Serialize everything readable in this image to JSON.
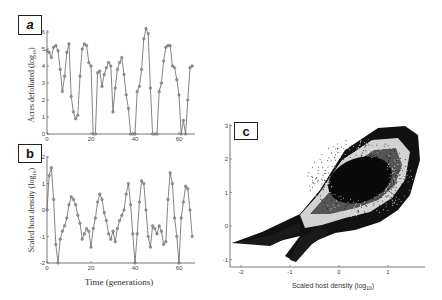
{
  "figure": {
    "panels": [
      {
        "label": "a"
      },
      {
        "label": "b"
      },
      {
        "label": "c"
      }
    ]
  },
  "chart_data": [
    {
      "panel": "a",
      "type": "line",
      "title": "",
      "xlabel": "",
      "ylabel": "Acres defoliated (log10)",
      "xlim": [
        0,
        66
      ],
      "ylim": [
        0,
        6
      ],
      "xticks": [
        0,
        20,
        40,
        60
      ],
      "yticks": [
        0,
        1,
        2,
        3,
        4,
        5,
        6
      ],
      "grid": false,
      "markers": true,
      "x": [
        0,
        1,
        2,
        3,
        4,
        5,
        6,
        7,
        8,
        9,
        10,
        11,
        12,
        13,
        14,
        15,
        16,
        17,
        18,
        19,
        20,
        21,
        22,
        23,
        24,
        25,
        26,
        27,
        28,
        29,
        30,
        31,
        32,
        33,
        34,
        35,
        36,
        37,
        38,
        39,
        40,
        41,
        42,
        43,
        44,
        45,
        46,
        47,
        48,
        49,
        50,
        51,
        52,
        53,
        54,
        55,
        56,
        57,
        58,
        59,
        60,
        61,
        62,
        63,
        64,
        65,
        66
      ],
      "values": [
        4.9,
        4.8,
        4.5,
        5.1,
        5.2,
        4.9,
        3.8,
        2.5,
        3.4,
        4.8,
        5.3,
        2.2,
        1.3,
        0.9,
        1.1,
        3.4,
        5.0,
        5.3,
        5.2,
        4.2,
        4.0,
        0,
        0,
        3.6,
        3.7,
        2.8,
        3.5,
        3.9,
        4.2,
        4.0,
        1.3,
        2.7,
        3.8,
        4.2,
        4.5,
        3.5,
        2.3,
        1.5,
        0,
        0,
        0,
        2.5,
        2.8,
        3.8,
        5.6,
        6.2,
        5.9,
        2.7,
        0,
        0,
        0,
        2.5,
        3.0,
        4.3,
        5.1,
        5.2,
        5.2,
        4.0,
        3.9,
        3.2,
        2.3,
        0,
        0.8,
        0,
        2.0,
        3.9,
        4.0
      ]
    },
    {
      "panel": "b",
      "type": "line",
      "title": "",
      "xlabel": "Time (generations)",
      "ylabel": "Scaled host density (log10)",
      "xlim": [
        0,
        66
      ],
      "ylim": [
        -2,
        2
      ],
      "xticks": [
        0,
        20,
        40,
        60
      ],
      "yticks": [
        -2,
        -1,
        0,
        1,
        2
      ],
      "grid": false,
      "markers": true,
      "x": [
        0,
        1,
        2,
        3,
        4,
        5,
        6,
        7,
        8,
        9,
        10,
        11,
        12,
        13,
        14,
        15,
        16,
        17,
        18,
        19,
        20,
        21,
        22,
        23,
        24,
        25,
        26,
        27,
        28,
        29,
        30,
        31,
        32,
        33,
        34,
        35,
        36,
        37,
        38,
        39,
        40,
        41,
        42,
        43,
        44,
        45,
        46,
        47,
        48,
        49,
        50,
        51,
        52,
        53,
        54,
        55,
        56,
        57,
        58,
        59,
        60,
        61,
        62,
        63,
        64,
        65,
        66
      ],
      "values": [
        0,
        1.3,
        1.6,
        0.4,
        -1.3,
        -2,
        -1.1,
        -0.8,
        -0.6,
        -0.3,
        0.2,
        0.5,
        0.4,
        0.2,
        -0.2,
        -0.5,
        -1.1,
        -0.9,
        -0.7,
        -0.8,
        -1.4,
        -0.7,
        -0.3,
        0.3,
        0.6,
        0.4,
        -0.1,
        -0.4,
        -0.9,
        -1.1,
        -0.8,
        -1.2,
        -0.7,
        -0.4,
        -0.2,
        0,
        0.6,
        1.0,
        0.2,
        -0.9,
        -2,
        -0.9,
        0.3,
        1.1,
        1.0,
        0,
        -1.0,
        -1.4,
        -0.6,
        -0.7,
        -0.9,
        -0.6,
        -0.8,
        -1.3,
        -1.2,
        0.4,
        1.4,
        1.0,
        -0.3,
        -1.0,
        -2,
        -0.3,
        0.3,
        0.9,
        0.8,
        0.0,
        -1.0
      ]
    },
    {
      "panel": "c",
      "type": "scatter",
      "title": "",
      "xlabel": "Scaled host density (log10)",
      "ylabel": "",
      "xlim": [
        -2.2,
        1.8
      ],
      "ylim": [
        -1.1,
        3.1
      ],
      "xticks": [
        -2,
        -1,
        0,
        1
      ],
      "yticks": [
        -1,
        0,
        1,
        2,
        3
      ],
      "grid": false,
      "description": "Dense phase-space point cloud forming a fish/teardrop-shaped attractor: outer dark band, lighter ring, dark elliptical core centered near (0.3, 1.6); a tail extending left to (-2.1, 0.45) and a lower spur down to (-1, -1)."
    }
  ],
  "ticks": {
    "a_y": [
      "0",
      "1",
      "2",
      "3",
      "4",
      "5",
      "6"
    ],
    "a_x": [
      "0",
      "20",
      "40",
      "60"
    ],
    "b_y": [
      "-2",
      "-1",
      "0",
      "1",
      "2"
    ],
    "b_x": [
      "0",
      "20",
      "40",
      "60"
    ],
    "c_y": [
      "-1",
      "0",
      "1",
      "2",
      "3"
    ],
    "c_x": [
      "-2",
      "-1",
      "0",
      "1"
    ]
  },
  "axis_labels": {
    "a_y": "Acres defoliated (log",
    "a_y_sub": "10",
    "a_y_end": ")",
    "b_y": "Scaled host density (log",
    "b_y_sub": "10",
    "b_y_end": ")",
    "b_x": "Time (generations)",
    "c_x": "Scaled host density (log",
    "c_x_sub": "10",
    "c_x_end": ")"
  },
  "colors": {
    "line": "#666666",
    "marker": "#888888",
    "axis": "#555555",
    "scatter": "#000000"
  }
}
